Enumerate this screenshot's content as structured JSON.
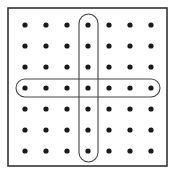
{
  "diagram": {
    "grid": {
      "rows": 7,
      "cols": 7,
      "x": [
        25,
        46,
        67,
        88,
        109,
        130,
        151
      ],
      "y": [
        25,
        46,
        67,
        88,
        109,
        130,
        151
      ],
      "dot_radius": 2.6,
      "dot_color": "#1a1a1a"
    },
    "border": {
      "x": 8,
      "y": 8,
      "width": 159,
      "height": 158,
      "color": "#333333"
    },
    "highlights": [
      {
        "type": "column",
        "index": 3,
        "x": 79,
        "y": 14,
        "width": 19,
        "height": 148,
        "rx": 9.5
      },
      {
        "type": "row",
        "index": 3,
        "x": 16,
        "y": 79,
        "width": 144,
        "height": 18,
        "rx": 9
      }
    ],
    "outline_color": "#444444"
  }
}
